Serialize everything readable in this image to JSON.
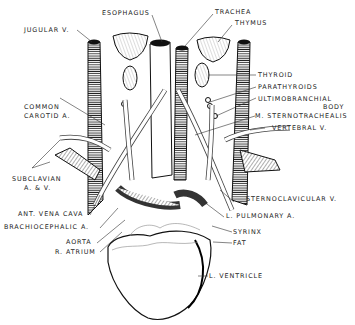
{
  "figure": {
    "ink_color": "#1a1a1a",
    "background": "#ffffff"
  },
  "labels": {
    "esophagus": "ESOPHAGUS",
    "trachea": "TRACHEA",
    "thymus": "THYMUS",
    "jugular_v": "JUGULAR V.",
    "thyroid": "THYROID",
    "parathyroids": "PARATHYROIDS",
    "ultimobranchial_1": "ULTIMOBRANCHIAL",
    "ultimobranchial_2": "BODY",
    "common_carotid_1": "COMMON",
    "common_carotid_2": "CAROTID A.",
    "m_sternotrachealis": "M. STERNOTRACHEALIS",
    "vertebral_v": "VERTEBRAL V.",
    "subclavian_1": "SUBCLAVIAN",
    "subclavian_2": "A. & V.",
    "sternoclavicular_v": "STERNOCLAVICULAR V.",
    "ant_vena_cava": "ANT. VENA CAVA",
    "l_pulmonary_a": "L. PULMONARY A.",
    "brachiocephalic_a": "BRACHIOCEPHALIC A.",
    "syrinx": "SYRINX",
    "fat": "FAT",
    "aorta": "AORTA",
    "r_atrium": "R. ATRIUM",
    "l_ventricle": "L. VENTRICLE"
  }
}
